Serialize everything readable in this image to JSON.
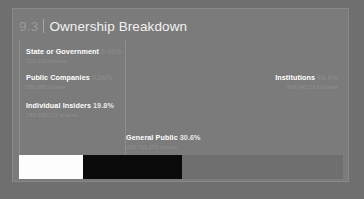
{
  "panel": {
    "section_number": "9.3",
    "title": "Ownership Breakdown"
  },
  "chart_data": {
    "type": "bar",
    "subtype": "stacked-horizontal-100pct",
    "title": "Ownership Breakdown",
    "categories": [
      "State or Government",
      "Public Companies",
      "Individual Insiders",
      "General Public",
      "Institutions"
    ],
    "values": [
      0.03,
      0.06,
      19.8,
      30.6,
      49.6
    ],
    "value_labels": [
      "0.03%",
      "0.06%",
      "19.8%",
      "30.6%",
      "49.6%"
    ],
    "shares": [
      310500,
      586080,
      188055272,
      289706279,
      469242563
    ],
    "share_labels": [
      "310,500 shares",
      "586,080 shares",
      "188,055,272 shares",
      "289,706,279 shares",
      "469,242,563 shares"
    ],
    "colors": [
      "#7e7e7e",
      "#7e7e7e",
      "#fdfdfd",
      "#0b0b0b",
      "#6f6f6f"
    ],
    "xlabel": "",
    "ylabel": "",
    "grid": false,
    "legend": "inline-callouts"
  },
  "callouts": {
    "state": {
      "label": "State or Government",
      "pct": "0.03%",
      "shares": "310,500 shares"
    },
    "public_companies": {
      "label": "Public Companies",
      "pct": "0.06%",
      "shares": "586,080 shares"
    },
    "individual_insiders": {
      "label": "Individual Insiders",
      "pct": "19.8%",
      "shares": "188,055,272 shares"
    },
    "general_public": {
      "label": "General Public",
      "pct": "30.6%",
      "shares": "289,706,279 shares"
    },
    "institutions": {
      "label": "Institutions",
      "pct": "49.6%",
      "shares": "469,242,563 shares"
    }
  }
}
